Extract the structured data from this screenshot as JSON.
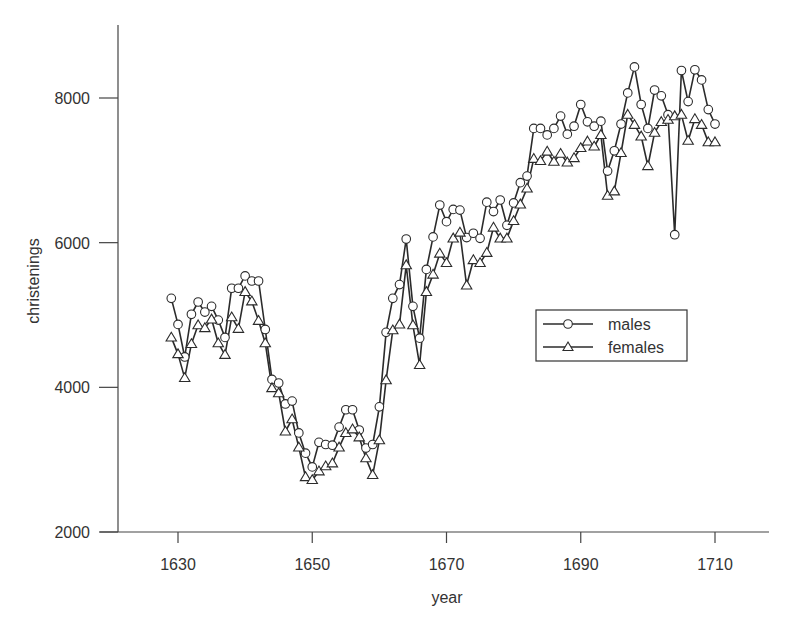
{
  "chart_data": {
    "type": "line",
    "title": "",
    "xlabel": "year",
    "ylabel": "christenings",
    "xlim": [
      1621,
      1718
    ],
    "ylim": [
      2000,
      9000
    ],
    "x_ticks": [
      1630,
      1650,
      1670,
      1690,
      1710
    ],
    "y_ticks": [
      2000,
      4000,
      6000,
      8000
    ],
    "grid": false,
    "legend_position": "center-right",
    "x": [
      1629,
      1630,
      1631,
      1632,
      1633,
      1634,
      1635,
      1636,
      1637,
      1638,
      1639,
      1640,
      1641,
      1642,
      1643,
      1644,
      1645,
      1646,
      1647,
      1648,
      1649,
      1650,
      1651,
      1652,
      1653,
      1654,
      1655,
      1656,
      1657,
      1658,
      1659,
      1660,
      1661,
      1662,
      1663,
      1664,
      1665,
      1666,
      1667,
      1668,
      1669,
      1670,
      1671,
      1672,
      1673,
      1674,
      1675,
      1676,
      1677,
      1678,
      1679,
      1680,
      1681,
      1682,
      1683,
      1684,
      1685,
      1686,
      1687,
      1688,
      1689,
      1690,
      1691,
      1692,
      1693,
      1694,
      1695,
      1696,
      1697,
      1698,
      1699,
      1700,
      1701,
      1702,
      1703,
      1704,
      1705,
      1706,
      1707,
      1708,
      1709,
      1710
    ],
    "series": [
      {
        "name": "males",
        "marker": "circle",
        "values": [
          5230,
          4870,
          4420,
          5010,
          5180,
          5040,
          5120,
          4930,
          4690,
          5370,
          5370,
          5540,
          5470,
          5470,
          4800,
          4110,
          4060,
          3770,
          3810,
          3370,
          3090,
          2900,
          3240,
          3210,
          3200,
          3450,
          3690,
          3690,
          3410,
          3160,
          3210,
          3730,
          4760,
          5230,
          5420,
          6050,
          5120,
          4680,
          5630,
          6080,
          6520,
          6290,
          6460,
          6450,
          6070,
          6130,
          6060,
          6560,
          6430,
          6590,
          6240,
          6550,
          6830,
          6920,
          7580,
          7580,
          7490,
          7580,
          7750,
          7500,
          7610,
          7910,
          7670,
          7610,
          7680,
          6990,
          7270,
          7640,
          8070,
          8430,
          7910,
          7580,
          8110,
          8030,
          7770,
          6110,
          8380,
          7950,
          8390,
          8250,
          7840,
          7640
        ]
      },
      {
        "name": "females",
        "marker": "triangle",
        "values": [
          4690,
          4460,
          4130,
          4600,
          4860,
          4820,
          4940,
          4610,
          4450,
          4970,
          4810,
          5320,
          5190,
          4920,
          4610,
          3990,
          3920,
          3390,
          3560,
          3170,
          2760,
          2720,
          2840,
          2910,
          2950,
          3170,
          3370,
          3420,
          3310,
          3020,
          2790,
          3270,
          4100,
          4790,
          4870,
          5690,
          4860,
          4310,
          5320,
          5560,
          5850,
          5720,
          6060,
          6140,
          5410,
          5760,
          5720,
          5860,
          6210,
          6060,
          6060,
          6300,
          6530,
          6750,
          7160,
          7130,
          7260,
          7120,
          7230,
          7110,
          7170,
          7310,
          7400,
          7330,
          7490,
          6650,
          6710,
          7240,
          7770,
          7630,
          7470,
          7060,
          7520,
          7670,
          7700,
          7750,
          7770,
          7410,
          7710,
          7630,
          7390,
          7390
        ]
      }
    ]
  },
  "legend": {
    "items": [
      {
        "label": "males",
        "marker": "circle"
      },
      {
        "label": "females",
        "marker": "triangle"
      }
    ]
  },
  "axes": {
    "x_title": "year",
    "y_title": "christenings",
    "x_tick_labels": [
      "1630",
      "1650",
      "1670",
      "1690",
      "1710"
    ],
    "y_tick_labels": [
      "2000",
      "4000",
      "6000",
      "8000"
    ]
  },
  "colors": {
    "line": "#2b2b2b",
    "marker_fill": "#ffffff",
    "axis": "#444444",
    "text": "#333333"
  }
}
